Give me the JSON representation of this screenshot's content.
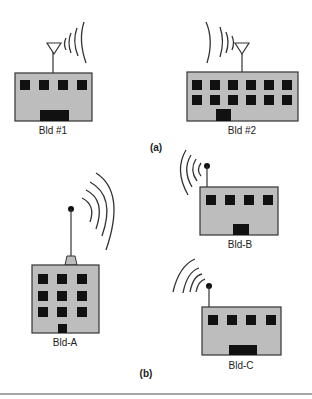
{
  "figure": {
    "panel_a": {
      "caption": "(a)",
      "buildings": [
        {
          "label": "Bld #1",
          "antenna": "dish-antenna",
          "window_rows": 1,
          "window_cols": 4
        },
        {
          "label": "Bld #2",
          "antenna": "dish-antenna",
          "window_rows": 2,
          "window_cols": 6
        }
      ]
    },
    "panel_b": {
      "caption": "(b)",
      "buildings": [
        {
          "label": "Bld-A",
          "antenna": "mast-antenna",
          "window_rows": 3,
          "window_cols": 3
        },
        {
          "label": "Bld-B",
          "antenna": "mast-antenna",
          "window_rows": 1,
          "window_cols": 4
        },
        {
          "label": "Bld-C",
          "antenna": "mast-antenna",
          "window_rows": 1,
          "window_cols": 4
        }
      ]
    },
    "colors": {
      "building_fill": "#bdbdbd",
      "outline": "#333333",
      "window": "#111111",
      "rule": "#888888"
    }
  }
}
